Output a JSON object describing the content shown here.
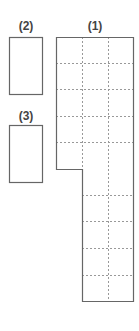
{
  "figures": [
    {
      "id": "fig1",
      "label": "(1)",
      "description": "L-shaped polygon on a dashed grid, 3 columns wide top section, 2 columns wide bottom section"
    },
    {
      "id": "fig2",
      "label": "(2)",
      "description": "empty rectangle"
    },
    {
      "id": "fig3",
      "label": "(3)",
      "description": "empty rectangle"
    }
  ],
  "grid": {
    "cell_size": 26,
    "columns_top": 3,
    "rows_top": 5,
    "columns_bottom": 2,
    "rows_bottom": 5
  },
  "colors": {
    "outline": "#666666",
    "dashed": "#999999",
    "label": "#444444"
  }
}
